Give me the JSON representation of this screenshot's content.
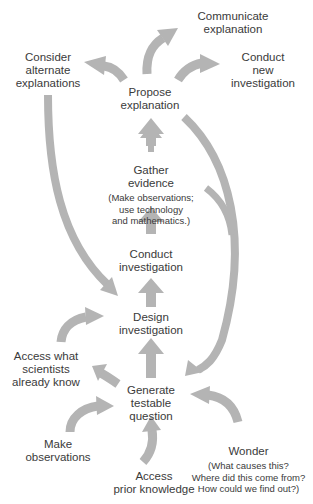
{
  "diagram": {
    "type": "flow-cycle",
    "arrow_color": "#b4b4b4",
    "text_color": "#3a3a3a",
    "background": "#ffffff",
    "nodes": {
      "communicate": {
        "label": "Communicate\nexplanation"
      },
      "consider": {
        "label": "Consider\nalternate\nexplanations"
      },
      "conduct_new": {
        "label": "Conduct\nnew\ninvestigation"
      },
      "propose": {
        "label": "Propose\nexplanation"
      },
      "gather": {
        "label": "Gather\nevidence",
        "sub": "(Make observations;\nuse technology\nand mathematics.)"
      },
      "conduct": {
        "label": "Conduct\ninvestigation"
      },
      "design": {
        "label": "Design\ninvestigation"
      },
      "access_scientists": {
        "label": "Access what\nscientists\nalready know"
      },
      "generate": {
        "label": "Generate\ntestable\nquestion"
      },
      "make_obs": {
        "label": "Make\nobservations"
      },
      "wonder": {
        "label": "Wonder",
        "sub": "(What causes this?\nWhere did this come from?\nHow could we find out?)"
      },
      "access_prior": {
        "label": "Access\nprior knowledge"
      }
    },
    "edges": [
      {
        "from": "make_obs",
        "to": "generate"
      },
      {
        "from": "access_prior",
        "to": "generate"
      },
      {
        "from": "wonder",
        "to": "generate"
      },
      {
        "from": "generate",
        "to": "access_scientists"
      },
      {
        "from": "access_scientists",
        "to": "design"
      },
      {
        "from": "generate",
        "to": "design"
      },
      {
        "from": "design",
        "to": "conduct"
      },
      {
        "from": "conduct",
        "to": "gather"
      },
      {
        "from": "gather",
        "to": "propose"
      },
      {
        "from": "propose",
        "to": "consider"
      },
      {
        "from": "propose",
        "to": "communicate"
      },
      {
        "from": "propose",
        "to": "conduct_new"
      },
      {
        "from": "consider",
        "to": "design"
      },
      {
        "from": "propose",
        "to": "generate"
      },
      {
        "from": "gather",
        "to": "generate"
      }
    ]
  }
}
